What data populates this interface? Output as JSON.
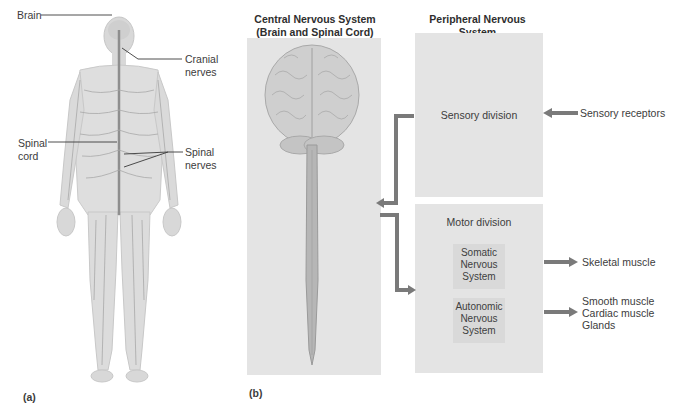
{
  "figure_a": {
    "panel_label": "(a)",
    "labels": {
      "brain": "Brain",
      "cranial_nerves_1": "Cranial",
      "cranial_nerves_2": "nerves",
      "spinal_cord_1": "Spinal",
      "spinal_cord_2": "cord",
      "spinal_nerves_1": "Spinal",
      "spinal_nerves_2": "nerves"
    }
  },
  "figure_b": {
    "panel_label": "(b)",
    "cns": {
      "title_1": "Central Nervous System",
      "title_2": "(Brain and Spinal Cord)"
    },
    "pns": {
      "title_1": "Peripheral Nervous System",
      "title_2": "(Cranial and Spinal Nerves)",
      "sensory_division": "Sensory division",
      "motor_division": "Motor division",
      "somatic": [
        "Somatic",
        "Nervous",
        "System"
      ],
      "autonomic": [
        "Autonomic",
        "Nervous",
        "System"
      ]
    },
    "targets": {
      "sensory_receptors": "Sensory receptors",
      "skeletal_muscle": "Skeletal muscle",
      "smooth_muscle": "Smooth muscle",
      "cardiac_muscle": "Cardiac muscle",
      "glands": "Glands"
    }
  },
  "colors": {
    "panel_bg": "#e4e4e4",
    "sub_box_bg": "#d9d9d9",
    "arrow": "#7a7a7a",
    "body_fill": "#dcdcdc",
    "nerve": "#9a9a9a"
  }
}
